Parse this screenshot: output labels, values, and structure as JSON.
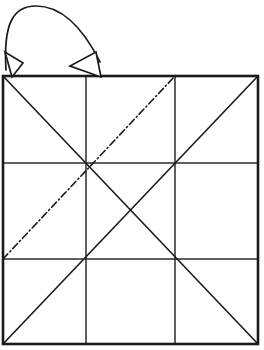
{
  "figure": {
    "canvas": {
      "width": 264,
      "height": 350,
      "background": "#ffffff"
    },
    "colors": {
      "stroke": "#1a1a1a",
      "grid_stroke": "#2b2b2b",
      "fold_stroke": "#1a1a1a",
      "arrow_stroke": "#1a1a1a",
      "arrow_fill": "#ffffff",
      "background": "#ffffff"
    },
    "square": {
      "label": "outer square",
      "left": 3,
      "top": 76,
      "right": 258,
      "bottom": 344,
      "stroke_width": 2.6
    },
    "grid": {
      "label": "3x3 grid",
      "vertical_lines_x": [
        86,
        175
      ],
      "horizontal_lines_y": [
        163,
        259
      ],
      "stroke_width": 1.5
    },
    "diagonals": [
      {
        "label": "diagonal top-left to bottom-right",
        "x1": 3,
        "y1": 76,
        "x2": 258,
        "y2": 344,
        "style": "solid",
        "stroke_width": 1.6
      },
      {
        "label": "diagonal bottom-left to top-right",
        "x1": 3,
        "y1": 344,
        "x2": 258,
        "y2": 76,
        "style": "solid",
        "stroke_width": 1.6
      }
    ],
    "fold_line": {
      "label": "dash-dot fold crease",
      "x1": 3,
      "y1": 259,
      "x2": 175,
      "y2": 76,
      "style": "dash-dot",
      "dash_pattern": "7 3 1.2 3",
      "stroke_width": 1.6
    },
    "fold_arrow": {
      "label": "curved fold-over arrow",
      "path": "M 6 70 C 3 22, 14 6, 36 6 C 66 6, 86 34, 100 62",
      "stroke_width": 1.7,
      "arrowheads": [
        {
          "label": "small arrowhead at left on top edge",
          "points": "12,77 5,52 23,63",
          "tip_x": 12,
          "tip_y": 77
        },
        {
          "label": "large open arrowhead at top edge",
          "points": "101,77 70,66 96,52",
          "tip_x": 101,
          "tip_y": 77
        }
      ]
    }
  }
}
